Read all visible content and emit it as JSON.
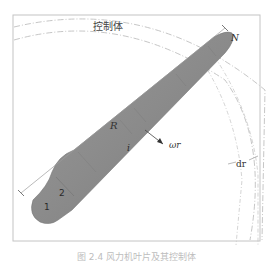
{
  "figure": {
    "control_volume_label": "控制体",
    "radius_label": "R",
    "velocity_label": "ωr",
    "annulus_width_label": "dr",
    "section_labels": {
      "first": "1",
      "second": "2",
      "middle": "i",
      "tip": "N"
    },
    "caption": "图 2.4  风力机叶片及其控制体",
    "colors": {
      "blade_fill": "#8f8f8f",
      "blade_edge": "#6d6d6d",
      "frame": "#bdbdbd",
      "dash_circle": "#b3b3b3",
      "dimension_line": "#9a9a9a"
    }
  }
}
